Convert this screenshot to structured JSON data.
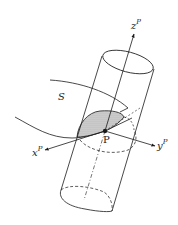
{
  "diagram": {
    "type": "geometric-figure",
    "labels": {
      "surface": "S",
      "point": "P",
      "z_axis": {
        "base": "z",
        "sup": "P"
      },
      "x_axis": {
        "base": "x",
        "sup": "P"
      },
      "y_axis": {
        "base": "y",
        "sup": "P"
      }
    },
    "colors": {
      "stroke": "#1a1a1a",
      "shaded_region": "#c8c8c8",
      "background": "#ffffff"
    }
  }
}
